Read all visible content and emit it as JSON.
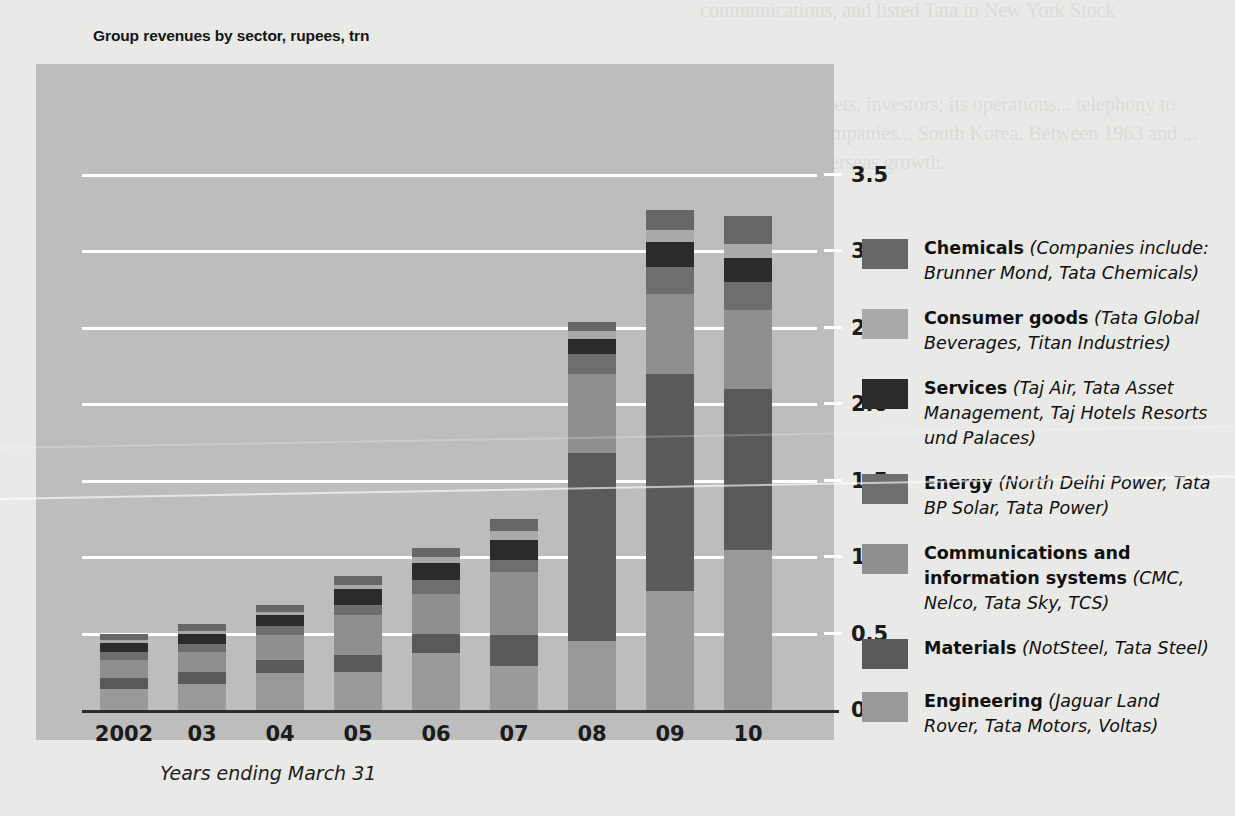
{
  "chart_data": {
    "type": "bar",
    "stacked": true,
    "title": "Group revenues by sector, rupees, trn",
    "xlabel": "Years ending March 31",
    "ylabel": "",
    "ylim": [
      0,
      3.5
    ],
    "yticks": [
      "0",
      "0.5",
      "1.0",
      "1.5",
      "2.0",
      "2.5",
      "3.0",
      "3.5"
    ],
    "ytick_values": [
      0,
      0.5,
      1.0,
      1.5,
      2.0,
      2.5,
      3.0,
      3.5
    ],
    "grid": true,
    "legend_position": "right",
    "categories": [
      "2002",
      "03",
      "04",
      "05",
      "06",
      "07",
      "08",
      "09",
      "10"
    ],
    "series": [
      {
        "name": "Engineering",
        "color": "#9a9a9a",
        "values": [
          0.14,
          0.17,
          0.24,
          0.25,
          0.37,
          0.29,
          0.45,
          0.78,
          1.05
        ]
      },
      {
        "name": "Materials",
        "color": "#5a5a5a",
        "values": [
          0.07,
          0.08,
          0.09,
          0.11,
          0.13,
          0.2,
          1.23,
          1.42,
          1.05
        ]
      },
      {
        "name": "Communications and information systems",
        "color": "#8f8f8f",
        "values": [
          0.12,
          0.13,
          0.16,
          0.26,
          0.26,
          0.41,
          0.52,
          0.52,
          0.52
        ]
      },
      {
        "name": "Energy",
        "color": "#6e6e6e",
        "values": [
          0.05,
          0.05,
          0.06,
          0.07,
          0.09,
          0.08,
          0.13,
          0.18,
          0.18
        ]
      },
      {
        "name": "Services",
        "color": "#2b2b2b",
        "values": [
          0.06,
          0.07,
          0.07,
          0.1,
          0.11,
          0.13,
          0.1,
          0.16,
          0.16
        ]
      },
      {
        "name": "Consumer goods",
        "color": "#a9a9a9",
        "values": [
          0.02,
          0.02,
          0.02,
          0.03,
          0.04,
          0.06,
          0.05,
          0.08,
          0.09
        ]
      },
      {
        "name": "Chemicals",
        "color": "#676767",
        "values": [
          0.04,
          0.04,
          0.05,
          0.06,
          0.06,
          0.08,
          0.06,
          0.13,
          0.18
        ]
      }
    ],
    "totals": [
      0.5,
      0.56,
      0.69,
      0.88,
      1.06,
      1.25,
      2.54,
      3.27,
      3.23
    ]
  },
  "legend": {
    "items": [
      {
        "label": "Chemicals",
        "companies": "(Companies include: Brunner Mond, Tata Chemicals)",
        "color": "#676767"
      },
      {
        "label": "Consumer goods",
        "companies": "(Tata Global Beverages, Titan Industries)",
        "color": "#a9a9a9"
      },
      {
        "label": "Services",
        "companies": "(Taj Air, Tata Asset Management, Taj Hotels Resorts und Palaces)",
        "color": "#2b2b2b"
      },
      {
        "label": "Energy",
        "companies": "(North Delhi Power, Tata BP Solar, Tata Power)",
        "color": "#6e6e6e"
      },
      {
        "label": "Communications and information systems",
        "companies": "(CMC, Nelco, Tata Sky, TCS)",
        "color": "#8f8f8f"
      },
      {
        "label": "Materials",
        "companies": "(NotSteel, Tata Steel)",
        "color": "#5a5a5a"
      },
      {
        "label": "Engineering",
        "companies": "(Jaguar Land Rover, Tata Motors, Voltas)",
        "color": "#9a9a9a"
      }
    ]
  },
  "page_background_text": {
    "top_right": "communications, and listed Tata in New York Stock",
    "right_block": "connecting markets, investors; its operations... telephony to several Asian companies... South Korea. Between 1963 and ... businesses in overseas growth."
  },
  "colors": {
    "panel_background": "#bdbdbd",
    "page_background": "#e9e9e7",
    "gridline": "#ffffff",
    "axis": "#2c2c2c",
    "text": "#101010"
  }
}
